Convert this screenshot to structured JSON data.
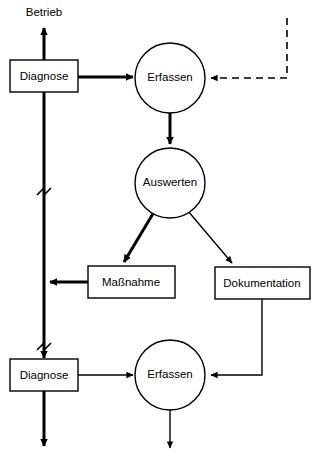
{
  "diagram": {
    "colors": {
      "stroke": "#000000",
      "fill": "#ffffff",
      "background": "#ffffff"
    },
    "nodes": [
      {
        "id": "betrieb",
        "label": "Betrieb",
        "shape": "text",
        "x": 44,
        "y": 12
      },
      {
        "id": "diagnose-top",
        "label": "Diagnose",
        "shape": "rect",
        "x": 44,
        "y": 76
      },
      {
        "id": "erfassen-top",
        "label": "Erfassen",
        "shape": "circle",
        "x": 170,
        "y": 78
      },
      {
        "id": "auswerten",
        "label": "Auswerten",
        "shape": "circle",
        "x": 170,
        "y": 183
      },
      {
        "id": "massnahme",
        "label": "Maßnahme",
        "shape": "rect",
        "x": 131,
        "y": 282
      },
      {
        "id": "dokumentation",
        "label": "Dokumentation",
        "shape": "rect",
        "x": 262,
        "y": 283
      },
      {
        "id": "diagnose-bottom",
        "label": "Diagnose",
        "shape": "rect",
        "x": 44,
        "y": 375
      },
      {
        "id": "erfassen-bottom",
        "label": "Erfassen",
        "shape": "circle",
        "x": 170,
        "y": 375
      }
    ],
    "edges": [
      {
        "id": "diagnose-to-betrieb",
        "from": "diagnose-top",
        "to": "betrieb",
        "style": "thick",
        "arrow": true
      },
      {
        "id": "diagnose-to-erfassen-top",
        "from": "diagnose-top",
        "to": "erfassen-top",
        "style": "thick",
        "arrow": true
      },
      {
        "id": "feedback-into-erfassen-top",
        "from": "external",
        "to": "erfassen-top",
        "style": "dashed",
        "arrow": true
      },
      {
        "id": "erfassen-to-auswerten",
        "from": "erfassen-top",
        "to": "auswerten",
        "style": "thick",
        "arrow": true
      },
      {
        "id": "auswerten-to-massnahme",
        "from": "auswerten",
        "to": "massnahme",
        "style": "thick",
        "arrow": true
      },
      {
        "id": "auswerten-to-dokumentation",
        "from": "auswerten",
        "to": "dokumentation",
        "style": "thin",
        "arrow": true
      },
      {
        "id": "massnahme-to-trunk",
        "from": "massnahme",
        "to": "trunk",
        "style": "thick",
        "arrow": true
      },
      {
        "id": "trunk-to-diagnose-bottom",
        "from": "trunk",
        "to": "diagnose-bottom",
        "style": "thick",
        "arrow": true
      },
      {
        "id": "diagnose-bottom-to-erfassen",
        "from": "diagnose-bottom",
        "to": "erfassen-bottom",
        "style": "thin",
        "arrow": true
      },
      {
        "id": "dokumentation-to-erfassen",
        "from": "dokumentation",
        "to": "erfassen-bottom",
        "style": "thin",
        "arrow": true
      },
      {
        "id": "diagnose-bottom-out",
        "from": "diagnose-bottom",
        "to": "out",
        "style": "thick",
        "arrow": true
      },
      {
        "id": "erfassen-bottom-out",
        "from": "erfassen-bottom",
        "to": "out",
        "style": "thin",
        "arrow": true
      }
    ],
    "break_marks": [
      {
        "id": "break-upper",
        "x": 44,
        "y": 192
      },
      {
        "id": "break-lower",
        "x": 44,
        "y": 347
      }
    ]
  }
}
